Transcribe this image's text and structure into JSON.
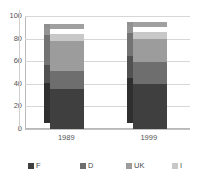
{
  "chart_data": {
    "type": "bar",
    "stacked": true,
    "title": "",
    "xlabel": "",
    "ylabel": "",
    "categories": [
      "1989",
      "1999"
    ],
    "ylim": [
      0,
      100
    ],
    "yticks": [
      0,
      20,
      40,
      60,
      80,
      100
    ],
    "ytick_labels": [
      "0",
      "20",
      "40",
      "60",
      "80",
      "100"
    ],
    "grid": true,
    "legend_position": "bottom",
    "series": [
      {
        "name": "F",
        "values": [
          35,
          40
        ],
        "color": "#3f3f3f"
      },
      {
        "name": "D",
        "values": [
          16,
          19
        ],
        "color": "#6e6e6e"
      },
      {
        "name": "UK",
        "values": [
          27,
          21
        ],
        "color": "#9c9c9c"
      },
      {
        "name": "I",
        "values": [
          6,
          6
        ],
        "color": "#c8c8c8"
      }
    ],
    "totals": [
      84,
      86
    ]
  },
  "legend": {
    "items": [
      {
        "label": "F"
      },
      {
        "label": "D"
      },
      {
        "label": "UK"
      },
      {
        "label": "I"
      }
    ]
  },
  "colors": {
    "background": "#ffffff",
    "axis": "#b9b9b9",
    "gridline": "#d7d7d7",
    "tick_text": "#555555",
    "legend_text": "#4a4a4a"
  }
}
